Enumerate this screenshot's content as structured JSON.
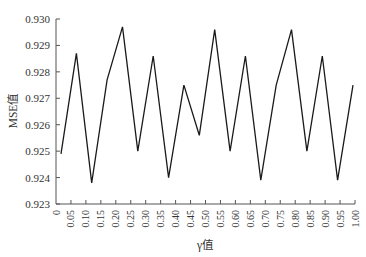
{
  "chart_data": {
    "type": "line",
    "title": "",
    "xlabel": "γ值",
    "ylabel": "MSE值",
    "xlim": [
      0,
      1.0
    ],
    "ylim": [
      0.923,
      0.93
    ],
    "grid": false,
    "legend": null,
    "x_tick_labels": [
      "0",
      "0.05",
      "0.10",
      "0.15",
      "0.20",
      "0.25",
      "0.30",
      "0.35",
      "0.40",
      "0.45",
      "0.50",
      "0.55",
      "0.60",
      "0.65",
      "0.70",
      "0.75",
      "0.80",
      "0.85",
      "0.90",
      "0.95",
      "1.00"
    ],
    "y_tick_labels": [
      "0.923",
      "0.924",
      "0.925",
      "0.926",
      "0.927",
      "0.928",
      "0.929",
      "0.930"
    ],
    "y_ticks": [
      0.923,
      0.924,
      0.925,
      0.926,
      0.927,
      0.928,
      0.929,
      0.93
    ],
    "x": [
      0.05,
      0.1,
      0.15,
      0.2,
      0.25,
      0.3,
      0.35,
      0.4,
      0.45,
      0.5,
      0.55,
      0.6,
      0.65,
      0.7,
      0.75,
      0.8,
      0.85,
      0.9,
      0.95,
      1.0
    ],
    "series": [
      {
        "name": "MSE",
        "color": "#1a1a1a",
        "values": [
          0.9249,
          0.9287,
          0.9238,
          0.9277,
          0.9297,
          0.925,
          0.9286,
          0.924,
          0.9275,
          0.9256,
          0.9296,
          0.925,
          0.9286,
          0.9239,
          0.9275,
          0.9296,
          0.925,
          0.9286,
          0.9239,
          0.9275
        ]
      }
    ]
  }
}
